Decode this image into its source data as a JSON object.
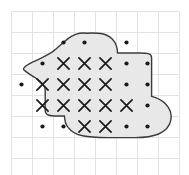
{
  "figure": {
    "title": "Irregular region overlaid on a square grid",
    "type": "grid-area-estimation"
  },
  "grid": {
    "columns": 8,
    "rows": 8,
    "cell_size_px": 21,
    "origin_x_px": 11,
    "origin_y_px": 11,
    "line_color": "#e3e3e3",
    "line_width_px": 1,
    "background_color": "#ffffff"
  },
  "region": {
    "fill_color": "#e8e8e8",
    "stroke_color": "#3b3b3b",
    "stroke_width_px": 1.4,
    "path": "M 86.5,33.2 C 80.0,32.4 73.5,34.5 68.0,38.6 C 62.5,42.8 57.5,48.4 52.0,52.2 C 46.0,56.4 39.0,59.0 32.5,62.2 C 29.5,63.7 26.0,65.6 24.2,67.6 C 23.3,68.6 23.3,69.4 24.3,70.3 C 27.5,73.2 32.0,75.6 35.6,78.0 C 38.6,80.0 41.3,82.0 43.3,84.6 C 44.6,86.3 45.2,88.4 45.2,90.6 L 45.2,110.0 C 45.2,112.6 46.0,114.2 48.2,115.0 C 52.0,116.3 56.6,116.0 60.2,116.0 L 64.5,116.0 C 64.5,120.0 65.6,124.2 68.2,127.6 C 71.6,132.0 77.0,134.6 82.6,135.8 C 90.5,137.5 99.0,137.6 107.0,137.6 L 135.0,137.6 C 143.0,137.6 151.5,137.0 158.6,134.0 C 164.6,131.4 169.5,126.6 170.8,120.4 C 172.0,114.4 169.6,108.0 165.2,103.6 C 161.5,99.9 156.6,97.6 151.6,96.4 L 151.6,58.0 C 151.6,55.6 151.0,54.2 148.6,53.6 C 145.6,52.9 142.0,53.0 139.0,53.0 L 117.5,53.0 C 117.5,48.0 116.0,43.0 112.5,39.2 C 109.0,35.4 103.4,33.5 98.0,33.2 C 94.2,33.0 90.3,33.0 86.5,33.2 Z",
    "inner_step_path": "M 151.6,74.2 L 151.6,96.4"
  },
  "marks": {
    "full_square_symbol": "X",
    "partial_square_symbol": "dot",
    "full_square_color": "#1a1a1a",
    "partial_square_color": "#1a1a1a",
    "full_count": 14,
    "partial_count": 14,
    "full_squares": [
      {
        "col": 2,
        "row": 2
      },
      {
        "col": 3,
        "row": 2
      },
      {
        "col": 4,
        "row": 2
      },
      {
        "col": 1,
        "row": 3
      },
      {
        "col": 2,
        "row": 3
      },
      {
        "col": 3,
        "row": 3
      },
      {
        "col": 4,
        "row": 3
      },
      {
        "col": 1,
        "row": 4
      },
      {
        "col": 2,
        "row": 4
      },
      {
        "col": 3,
        "row": 4
      },
      {
        "col": 4,
        "row": 4
      },
      {
        "col": 5,
        "row": 4
      },
      {
        "col": 3,
        "row": 5
      },
      {
        "col": 4,
        "row": 5
      }
    ],
    "partial_squares": [
      {
        "col": 2,
        "row": 1
      },
      {
        "col": 3,
        "row": 1
      },
      {
        "col": 1,
        "row": 2
      },
      {
        "col": 5,
        "row": 2
      },
      {
        "col": 0,
        "row": 3
      },
      {
        "col": 5,
        "row": 3
      },
      {
        "col": 6,
        "row": 4
      },
      {
        "col": 2,
        "row": 5
      },
      {
        "col": 5,
        "row": 5
      },
      {
        "col": 6,
        "row": 5
      },
      {
        "col": 1,
        "row": 5
      },
      {
        "col": 6,
        "row": 3
      },
      {
        "col": 5,
        "row": 1
      },
      {
        "col": 6,
        "row": 2
      }
    ]
  }
}
